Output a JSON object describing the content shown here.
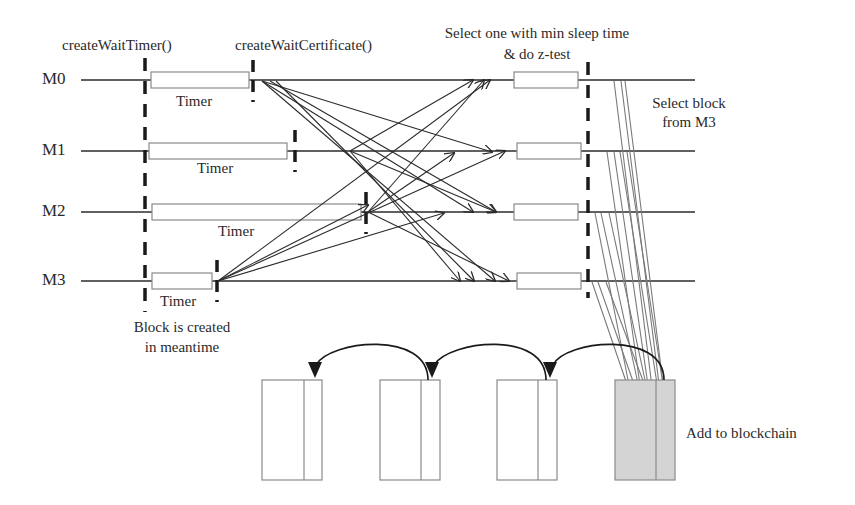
{
  "diagram": {
    "type": "PoET consensus timing diagram",
    "machines": [
      "M0",
      "M1",
      "M2",
      "M3"
    ],
    "labels": {
      "create_wait_timer": "createWaitTimer()",
      "create_wait_certificate": "createWaitCertificate()",
      "select_min_line1": "Select one with min sleep time",
      "select_min_line2": "& do z-test",
      "select_block_line1": "Select block",
      "select_block_line2": "from M3",
      "block_created_line1": "Block is created",
      "block_created_line2": "in meantime",
      "add_to_blockchain": "Add to blockchain"
    },
    "timers": [
      {
        "machine": "M0",
        "label": "Timer"
      },
      {
        "machine": "M1",
        "label": "Timer"
      },
      {
        "machine": "M2",
        "label": "Timer"
      },
      {
        "machine": "M3",
        "label": "Timer"
      }
    ],
    "blockchain": {
      "blocks": 4,
      "new_block_fill": "#d4d4d4"
    },
    "colors": {
      "line": "#2b2b2b",
      "box_stroke": "#8a8a8a",
      "grey_arrow": "#7a7a7a"
    }
  }
}
